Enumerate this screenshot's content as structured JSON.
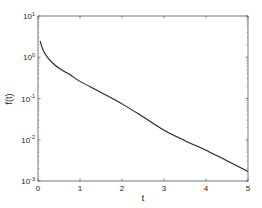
{
  "chart_data": {
    "type": "line",
    "title": "",
    "xlabel": "t",
    "ylabel": "f(t)",
    "xlim": [
      0,
      5
    ],
    "ylim": [
      0.001,
      10
    ],
    "yscale": "log",
    "grid": false,
    "legend": null,
    "x_ticks": [
      "0",
      "1",
      "2",
      "3",
      "4",
      "5"
    ],
    "y_ticks": [
      {
        "base": "10",
        "exp": "1",
        "value": 10
      },
      {
        "base": "10",
        "exp": "0",
        "value": 1
      },
      {
        "base": "10",
        "exp": "-1",
        "value": 0.1
      },
      {
        "base": "10",
        "exp": "-2",
        "value": 0.01
      },
      {
        "base": "10",
        "exp": "-3",
        "value": 0.001
      }
    ],
    "series": [
      {
        "name": "f(t)",
        "color": "#222222",
        "x": [
          0.05,
          0.12,
          0.24,
          0.4,
          0.57,
          0.76,
          1.0,
          1.5,
          2.0,
          2.5,
          3.0,
          3.5,
          4.0,
          4.5,
          5.0
        ],
        "y": [
          2.5,
          1.5,
          0.95,
          0.65,
          0.49,
          0.38,
          0.26,
          0.14,
          0.074,
          0.036,
          0.017,
          0.0095,
          0.0056,
          0.0031,
          0.0017
        ]
      }
    ]
  }
}
